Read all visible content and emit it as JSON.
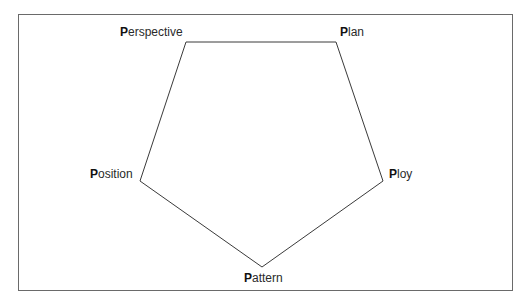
{
  "diagram": {
    "title": "",
    "nodes": [
      {
        "id": "perspective",
        "initial": "P",
        "rest": "erspective",
        "label": "Perspective",
        "x": 186,
        "y": 42
      },
      {
        "id": "plan",
        "initial": "P",
        "rest": "lan",
        "label": "Plan",
        "x": 336,
        "y": 42
      },
      {
        "id": "ploy",
        "initial": "P",
        "rest": "loy",
        "label": "Ploy",
        "x": 383,
        "y": 181
      },
      {
        "id": "pattern",
        "initial": "P",
        "rest": "attern",
        "label": "Pattern",
        "x": 262,
        "y": 267
      },
      {
        "id": "position",
        "initial": "P",
        "rest": "osition",
        "label": "Position",
        "x": 140,
        "y": 181
      }
    ],
    "edges": [
      [
        "perspective",
        "plan"
      ],
      [
        "plan",
        "ploy"
      ],
      [
        "ploy",
        "pattern"
      ],
      [
        "pattern",
        "position"
      ],
      [
        "position",
        "perspective"
      ]
    ],
    "line_color": "#3a3a3a",
    "frame_color": "#6a6a6a"
  }
}
